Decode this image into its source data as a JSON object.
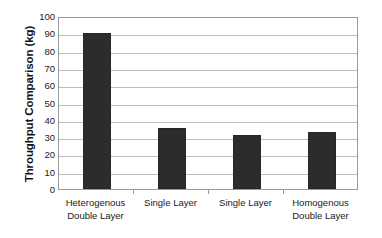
{
  "chart_data": {
    "type": "bar",
    "title": "",
    "xlabel": "",
    "ylabel": "Throughput Comparison (kg)",
    "ylim": [
      0,
      100
    ],
    "yticks": [
      0,
      10,
      20,
      30,
      40,
      50,
      60,
      70,
      80,
      90,
      100
    ],
    "ytick_labels": [
      "0",
      "10",
      "20",
      "30",
      "40",
      "50",
      "60",
      "70",
      "80",
      "90",
      "100"
    ],
    "grid": true,
    "legend": null,
    "categories": [
      "Heterogenous Double Layer",
      "Single Layer",
      "Single Layer",
      "Homogenous Double Layer"
    ],
    "category_lines": [
      [
        "Heterogenous",
        "Double Layer"
      ],
      [
        "Single Layer",
        ""
      ],
      [
        "Single Layer",
        ""
      ],
      [
        "Homogenous",
        "Double Layer"
      ]
    ],
    "values": [
      90,
      35,
      31,
      33
    ],
    "bar_color": "#2c2c2c",
    "plot_border_color": "#9a9a9a",
    "gridline_color": "#bdbdbd",
    "background_color": "#ffffff"
  }
}
